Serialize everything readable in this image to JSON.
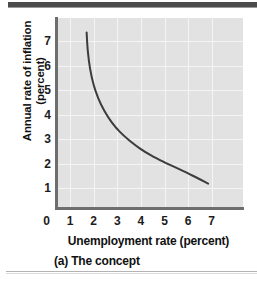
{
  "figure": {
    "caption": "(a) The concept"
  },
  "chart_data": {
    "type": "line",
    "title": "",
    "subtitle": "",
    "xlabel": "Unemployment rate (percent)",
    "ylabel_line1": "Annual rate of inflation",
    "ylabel_line2": "(percent)",
    "ylabel": "Annual rate of inflation (percent)",
    "xlim": [
      0,
      7.7
    ],
    "ylim": [
      0,
      7.7
    ],
    "xticks": [
      0,
      1,
      2,
      3,
      4,
      5,
      6,
      7
    ],
    "yticks": [
      1,
      2,
      3,
      4,
      5,
      6,
      7
    ],
    "xticklabels": [
      "0",
      "1",
      "2",
      "3",
      "4",
      "5",
      "6",
      "7"
    ],
    "yticklabels": [
      "1",
      "2",
      "3",
      "4",
      "5",
      "6",
      "7"
    ],
    "grid": true,
    "legend": "none",
    "series": [
      {
        "name": "Phillips curve",
        "color": "#3c3c3c",
        "linewidth": 2,
        "x": [
          1.7,
          1.75,
          1.85,
          2.0,
          2.2,
          2.45,
          2.75,
          3.1,
          3.5,
          3.95,
          4.45,
          5.0,
          5.6,
          6.2,
          6.85
        ],
        "y": [
          7.35,
          6.6,
          5.85,
          5.2,
          4.65,
          4.15,
          3.7,
          3.3,
          2.95,
          2.62,
          2.32,
          2.05,
          1.78,
          1.5,
          1.18
        ]
      }
    ],
    "plot_bg_color": "#e2e2e2",
    "grid_color": "#f4f4f4",
    "axis_color": "#6e6e6e"
  }
}
